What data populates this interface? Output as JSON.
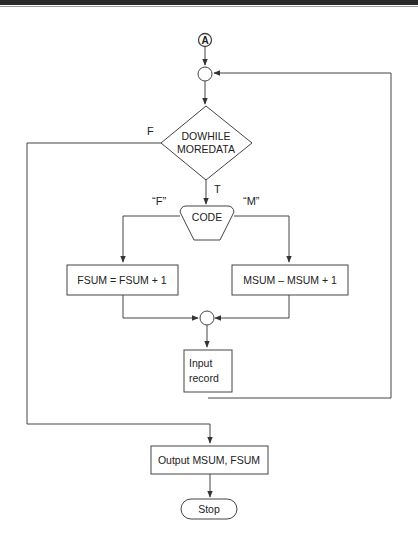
{
  "connector": {
    "label": "A"
  },
  "decision": {
    "line1": "DOWHILE",
    "line2": "MOREDATA",
    "true_label": "T",
    "false_label": "F"
  },
  "case": {
    "label": "CODE",
    "left_branch": "“F”",
    "right_branch": "“M”"
  },
  "process_fsum": {
    "label": "FSUM = FSUM + 1"
  },
  "process_msum": {
    "label": "MSUM – MSUM + 1"
  },
  "input": {
    "line1": "Input",
    "line2": "record"
  },
  "output": {
    "label": "Output MSUM, FSUM"
  },
  "terminal": {
    "label": "Stop"
  },
  "colors": {
    "line": "#333333",
    "text": "#222222",
    "background": "#ffffff"
  }
}
